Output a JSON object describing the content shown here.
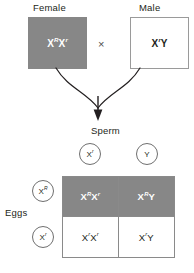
{
  "diagram": {
    "type": "punnett-square",
    "parents": {
      "female": {
        "label": "Female",
        "genotype_base": "X",
        "allele_1_sup": "R",
        "allele_2_base": "X",
        "allele_2_sup": "r",
        "shaded": true,
        "fill_color": "#878787"
      },
      "male": {
        "label": "Male",
        "genotype_base": "X",
        "allele_1_sup": "r",
        "allele_2_base": "Y",
        "shaded": false,
        "fill_color": "#ffffff"
      },
      "cross_symbol": "×"
    },
    "gametes": {
      "sperm_label": "Sperm",
      "eggs_label": "Eggs",
      "sperm": [
        {
          "base": "X",
          "sup": "r"
        },
        {
          "base": "Y",
          "sup": ""
        }
      ],
      "eggs": [
        {
          "base": "X",
          "sup": "R"
        },
        {
          "base": "X",
          "sup": "r"
        }
      ]
    },
    "offspring": [
      {
        "row": 0,
        "col": 0,
        "parts": [
          {
            "base": "X",
            "sup": "R"
          },
          {
            "base": "X",
            "sup": "r"
          }
        ],
        "shaded": true
      },
      {
        "row": 0,
        "col": 1,
        "parts": [
          {
            "base": "X",
            "sup": "R"
          },
          {
            "base": "Y",
            "sup": ""
          }
        ],
        "shaded": true
      },
      {
        "row": 1,
        "col": 0,
        "parts": [
          {
            "base": "X",
            "sup": "r"
          },
          {
            "base": "X",
            "sup": "r"
          }
        ],
        "shaded": false
      },
      {
        "row": 1,
        "col": 1,
        "parts": [
          {
            "base": "X",
            "sup": "r"
          },
          {
            "base": "Y",
            "sup": ""
          }
        ],
        "shaded": false
      }
    ],
    "colors": {
      "shade": "#878787",
      "outline": "#8a8a8a",
      "text": "#231f20",
      "shaded_text": "#ffffff",
      "arrow": "#231f20"
    }
  }
}
